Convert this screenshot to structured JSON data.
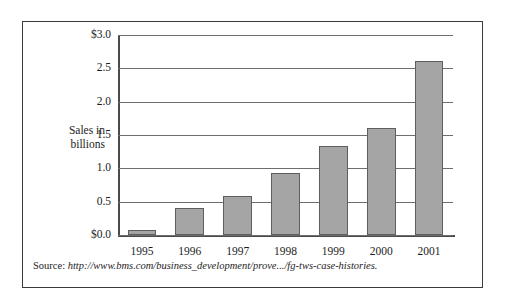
{
  "figure": {
    "source_label": "Source:",
    "source_url": "http://www.bms.com/business_development/prove.../fg-tws-case-histories."
  },
  "chart_data": {
    "type": "bar",
    "title": "",
    "subtitle": "",
    "xlabel": "",
    "ylabel": "Sales in billions",
    "ylabel_line1": "Sales in",
    "ylabel_line2": "billions",
    "categories": [
      "1995",
      "1996",
      "1997",
      "1998",
      "1999",
      "2000",
      "2001"
    ],
    "values": [
      0.07,
      0.4,
      0.58,
      0.93,
      1.33,
      1.61,
      2.61
    ],
    "series": [
      {
        "name": "Sales",
        "values": [
          0.07,
          0.4,
          0.58,
          0.93,
          1.33,
          1.61,
          2.61
        ]
      }
    ],
    "ylim": [
      0.0,
      3.0
    ],
    "yticks": [
      0.0,
      0.5,
      1.0,
      1.5,
      2.0,
      2.5,
      3.0
    ],
    "ytick_labels": [
      "$0.0",
      "0.5",
      "1.0",
      "1.5",
      "2.0",
      "2.5",
      "$3.0"
    ],
    "grid": true,
    "legend": false,
    "legend_position": "none",
    "bar_color": "#a5a5a5",
    "bar_border_color": "#5e5e5e",
    "gridline_color": "#6e6e6e",
    "axis_color": "#4a4a4a"
  }
}
